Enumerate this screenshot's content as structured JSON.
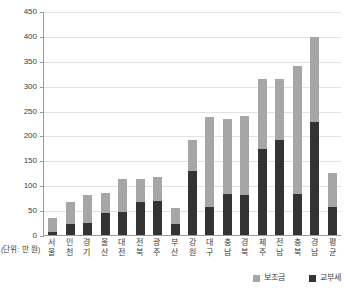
{
  "chart_data": {
    "type": "bar",
    "title": "",
    "subtitle": "",
    "xlabel": "",
    "ylabel": "",
    "unit_caption": "(단위: 만 원)",
    "stacked": true,
    "grid": true,
    "legend_position": "bottom-right",
    "ylim": [
      0,
      450
    ],
    "ytick_step": 50,
    "yticks": [
      "0",
      "50",
      "100",
      "150",
      "200",
      "250",
      "300",
      "350",
      "400",
      "450"
    ],
    "categories": [
      "서울",
      "인천",
      "경기",
      "울산",
      "대전",
      "전북",
      "광주",
      "부산",
      "강원",
      "대구",
      "충남",
      "경북",
      "제주",
      "전남",
      "충북",
      "경남",
      "평균"
    ],
    "series": [
      {
        "name": "교부세",
        "color": "#333333",
        "values": [
          6,
          22,
          24,
          44,
          46,
          66,
          68,
          22,
          128,
          56,
          82,
          80,
          172,
          190,
          82,
          228,
          56
        ]
      },
      {
        "name": "보조금",
        "color": "#a6a6a6",
        "values": [
          28,
          44,
          56,
          40,
          66,
          46,
          48,
          32,
          62,
          182,
          152,
          160,
          142,
          124,
          258,
          170,
          68
        ]
      }
    ],
    "totals": [
      34,
      66,
      80,
      84,
      112,
      112,
      116,
      54,
      190,
      238,
      234,
      240,
      314,
      314,
      340,
      398,
      124
    ]
  },
  "legend": {
    "items": [
      {
        "label": "보조금",
        "swatch": "#a6a6a6",
        "icon": "legend-swatch-grant"
      },
      {
        "label": "교부세",
        "swatch": "#333333",
        "icon": "legend-swatch-tax"
      }
    ]
  },
  "colors": {
    "grant": "#a6a6a6",
    "tax": "#333333",
    "axis": "#9c9c9c",
    "grid": "#e2e2e2",
    "text": "#3d3d3d",
    "background": "#ffffff"
  }
}
